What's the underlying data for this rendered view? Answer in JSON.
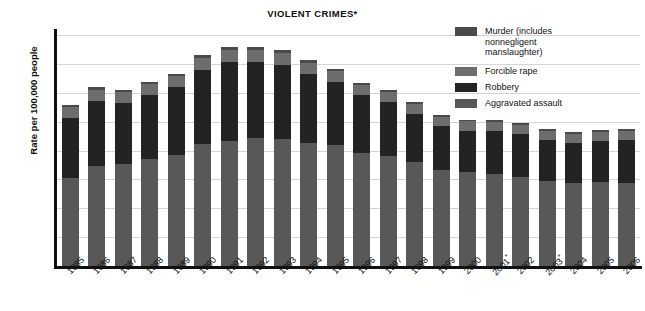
{
  "chart_data": {
    "type": "bar",
    "subtype": "stacked-vertical",
    "title": "VIOLENT CRIMES*",
    "xlabel": "",
    "ylabel": "Rate per 100,000 people",
    "ylim": [
      0,
      800
    ],
    "ytick_values": [
      0,
      100,
      200,
      300,
      400,
      500,
      600,
      700,
      800
    ],
    "ytick_labels": [
      "0",
      "100",
      "200",
      "300",
      "400",
      "500",
      "600",
      "700",
      "800"
    ],
    "grid": true,
    "grid_axis": "y",
    "legend_position": "top-right",
    "categories": [
      "1985",
      "1986",
      "1987",
      "1988",
      "1989",
      "1990",
      "1991",
      "1992",
      "1993",
      "1994",
      "1995",
      "1996",
      "1997",
      "1998",
      "1999",
      "2000",
      "2001",
      "2002",
      "2003",
      "2004",
      "2005",
      "2006"
    ],
    "category_marks": {
      "2001": "*",
      "2003": "*"
    },
    "series": [
      {
        "name": "Aggravated assault",
        "color": "#585858",
        "values": [
          305,
          347,
          352,
          372,
          385,
          423,
          433,
          442,
          440,
          427,
          418,
          391,
          382,
          361,
          334,
          324,
          319,
          310,
          295,
          289,
          291,
          288
        ]
      },
      {
        "name": "Robbery",
        "color": "#232323",
        "values": [
          209,
          226,
          213,
          221,
          234,
          257,
          273,
          264,
          256,
          238,
          221,
          201,
          186,
          166,
          150,
          145,
          149,
          146,
          142,
          137,
          141,
          149
        ]
      },
      {
        "name": "Forcible rape",
        "color": "#6d6d6d",
        "values": [
          37,
          38,
          37,
          38,
          38,
          41,
          42,
          43,
          41,
          39,
          37,
          36,
          36,
          34,
          33,
          32,
          32,
          33,
          32,
          32,
          32,
          31
        ]
      },
      {
        "name": "Murder (includes nonnegligent manslaughter)",
        "color": "#4a4a4a",
        "values": [
          8,
          9,
          8,
          8,
          9,
          9,
          10,
          9,
          10,
          9,
          8,
          7,
          7,
          6,
          6,
          6,
          6,
          6,
          6,
          5,
          6,
          6
        ]
      }
    ],
    "totals": [
      559,
      620,
      610,
      639,
      666,
      730,
      758,
      758,
      747,
      713,
      684,
      635,
      611,
      567,
      523,
      507,
      506,
      495,
      475,
      463,
      470,
      474
    ]
  },
  "legend": {
    "entries": [
      {
        "label": "Murder (includes\nnonnegligent\nmanslaughter)",
        "color": "#4a4a4a"
      },
      {
        "label": "Forcible rape",
        "color": "#6d6d6d"
      },
      {
        "label": "Robbery",
        "color": "#232323"
      },
      {
        "label": "Aggravated assault",
        "color": "#585858"
      }
    ]
  },
  "colors": {
    "background": "#ffffff",
    "axis": "#111111",
    "grid": "#d4d4d4",
    "text": "#111111"
  }
}
